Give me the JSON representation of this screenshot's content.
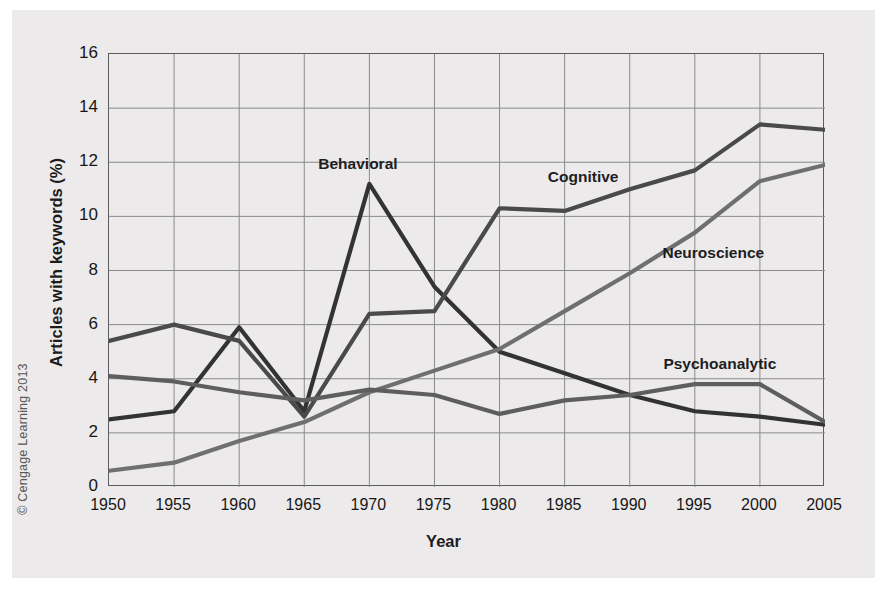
{
  "figure": {
    "copyright": "© Cengage Learning 2013"
  },
  "chart_data": {
    "type": "line",
    "title": "",
    "xlabel": "Year",
    "ylabel": "Articles with keywords (%)",
    "xlim": [
      1950,
      2005
    ],
    "ylim": [
      0,
      16
    ],
    "xticks": [
      "1950",
      "1955",
      "1960",
      "1965",
      "1970",
      "1975",
      "1980",
      "1985",
      "1990",
      "1995",
      "2000",
      "2005"
    ],
    "yticks": [
      "0",
      "2",
      "4",
      "6",
      "8",
      "10",
      "12",
      "14",
      "16"
    ],
    "grid": true,
    "legend_position": "inline-annotations",
    "x": [
      1950,
      1955,
      1960,
      1965,
      1970,
      1975,
      1980,
      1985,
      1990,
      1995,
      2000,
      2005
    ],
    "series": [
      {
        "name": "Behavioral",
        "color": "#333335",
        "values": [
          2.5,
          2.8,
          5.9,
          2.8,
          11.2,
          7.4,
          5.0,
          4.2,
          3.4,
          2.8,
          2.6,
          2.3
        ],
        "label_x": 1969.2,
        "label_y": 11.9
      },
      {
        "name": "Cognitive",
        "color": "#4a4a4c",
        "values": [
          5.4,
          6.0,
          5.4,
          2.6,
          6.4,
          6.5,
          10.3,
          10.2,
          11.0,
          11.7,
          13.4,
          13.2
        ],
        "label_x": 1986.5,
        "label_y": 11.4
      },
      {
        "name": "Neuroscience",
        "color": "#6f6f71",
        "values": [
          0.6,
          0.9,
          1.7,
          2.4,
          3.5,
          4.3,
          5.1,
          6.5,
          7.9,
          9.4,
          11.3,
          11.9
        ],
        "label_x": 1996.5,
        "label_y": 8.6
      },
      {
        "name": "Psychoanalytic",
        "color": "#5e5e60",
        "values": [
          4.1,
          3.9,
          3.5,
          3.2,
          3.6,
          3.4,
          2.7,
          3.2,
          3.4,
          3.8,
          3.8,
          2.4
        ],
        "label_x": 1997.0,
        "label_y": 4.5
      }
    ]
  }
}
